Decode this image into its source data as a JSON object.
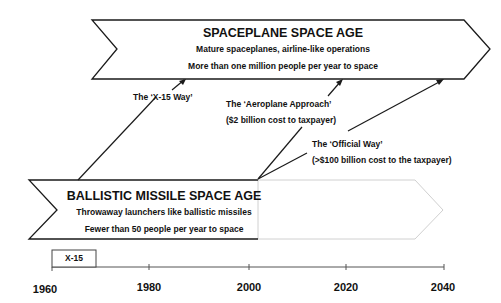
{
  "spaceplane_age": {
    "title": "SPACEPLANE SPACE AGE",
    "line1": "Mature spaceplanes, airline-like operations",
    "line2": "More than one million people per year to space"
  },
  "ballistic_age": {
    "title": "BALLISTIC MISSILE SPACE AGE",
    "line1": "Throwaway launchers like ballistic missiles",
    "line2": "Fewer than 50 people per year to space"
  },
  "paths": {
    "x15": {
      "label": "The ‘X-15 Way’"
    },
    "aeroplane": {
      "label": "The ‘Aeroplane Approach’",
      "cost": "($2 billion cost to taxpayer)"
    },
    "official": {
      "label": "The ‘Official Way’",
      "cost": "(>$100 billion cost to the taxpayer)"
    }
  },
  "timeline": {
    "program_box": "X-15",
    "ticks": [
      "1960",
      "1980",
      "2000",
      "2020",
      "2040"
    ]
  },
  "colors": {
    "stroke": "#1a1a1a",
    "faded_stroke": "#d0d0d0"
  }
}
